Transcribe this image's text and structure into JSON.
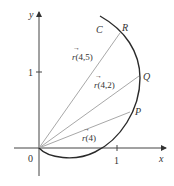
{
  "figure": {
    "axes": {
      "x_label": "x",
      "y_label": "y",
      "origin_label": "0",
      "x_tick_label": "1",
      "y_tick_label": "1"
    },
    "curve": {
      "label": "C"
    },
    "points": [
      {
        "name": "R",
        "label": "R"
      },
      {
        "name": "Q",
        "label": "Q"
      },
      {
        "name": "P",
        "label": "P"
      }
    ],
    "vectors": [
      {
        "to": "R",
        "arrow": "→",
        "label": "r(4,5)",
        "arg": "(4,5)"
      },
      {
        "to": "Q",
        "arrow": "→",
        "label": "r(4,2)",
        "arg": "(4,2)"
      },
      {
        "to": "P",
        "arrow": "→",
        "label": "r(4)",
        "arg": "(4)"
      }
    ],
    "colors": {
      "axis": "#333333",
      "curve": "#2a2a2a",
      "vector": "#a8a8a8",
      "text": "#333333"
    }
  }
}
